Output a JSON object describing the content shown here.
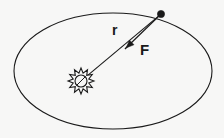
{
  "diagram": {
    "background_color": "#f7f7f6",
    "stroke_color": "#1a1a1a",
    "labels": {
      "radius_vector": "r",
      "force_vector": "F"
    },
    "elements": {
      "orbit_name": "elliptical-orbit",
      "star_name": "sun-symbol",
      "planet_name": "planet-dot",
      "radius_line_name": "radius-line",
      "force_arrow_name": "force-arrow"
    },
    "geometry": {
      "orbit_center_x": 113,
      "orbit_center_y": 71,
      "orbit_radius_x": 99,
      "orbit_radius_y": 58,
      "sun_center_x": 81,
      "sun_center_y": 81,
      "sun_radius": 13,
      "sun_core_radius": 6,
      "sun_ray_count": 12,
      "planet_x": 161,
      "planet_y": 14,
      "planet_radius": 3.6,
      "force_arrow_tip_x": 126,
      "force_arrow_tip_y": 48
    }
  }
}
